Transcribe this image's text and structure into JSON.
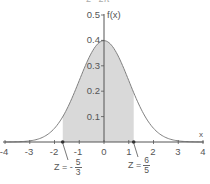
{
  "chart_data": {
    "type": "area",
    "top_formula_partial": "1/√(2π)",
    "xlabel": "x",
    "ylabel": "f(x)",
    "xlim": [
      -4,
      4
    ],
    "ylim": [
      0,
      0.5
    ],
    "x_ticks": [
      "-4",
      "-3",
      "-2",
      "-1",
      "0",
      "1",
      "2",
      "3",
      "4"
    ],
    "y_ticks": [
      "0.1",
      "0.2",
      "0.3",
      "0.4",
      "0.5"
    ],
    "curve": "f(x) = (1/√(2π)) e^(-x²/2)",
    "x": [
      -4,
      -3,
      -2,
      -1,
      0,
      1,
      2,
      3,
      4
    ],
    "values": [
      0.0001,
      0.0044,
      0.054,
      0.242,
      0.399,
      0.242,
      0.054,
      0.0044,
      0.0001
    ],
    "shaded_region": {
      "from": -1.6667,
      "to": 1.2,
      "color": "#d9d9d9"
    },
    "annotations": [
      {
        "label": "Z = -5/3",
        "x": -1.6667
      },
      {
        "label": "Z = 6/5",
        "x": 1.2
      }
    ],
    "grid": false
  },
  "labels": {
    "ylabel": "f(x)",
    "xlabel": "x",
    "y_ticks": [
      "0.5",
      "0.4",
      "0.3",
      "0.2",
      "0.1"
    ],
    "x_ticks": [
      "-4",
      "-3",
      "-2",
      "-1",
      "0",
      "1",
      "2",
      "3",
      "4"
    ],
    "z_left": {
      "prefix": "Z = -",
      "num": "5",
      "den": "3"
    },
    "z_right": {
      "prefix": "Z = ",
      "num": "6",
      "den": "5"
    }
  },
  "colors": {
    "shade": "#d9d9d9",
    "curve": "#808080",
    "axis": "#555555",
    "marker": "#333333"
  }
}
